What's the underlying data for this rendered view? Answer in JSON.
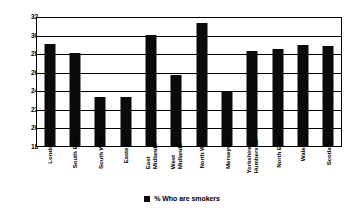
{
  "chart_data": {
    "type": "bar",
    "title": "",
    "xlabel": "",
    "ylabel": "",
    "ylim": [
      18,
      32
    ],
    "ytick_step": 2,
    "yticks": [
      18,
      20,
      22,
      24,
      26,
      28,
      30,
      32
    ],
    "grid": true,
    "legend_position": "bottom-center",
    "series": [
      {
        "name": "% Who are smokers",
        "color": "#0a0a0a",
        "values": [
          29.2,
          28.2,
          23.4,
          23.4,
          30.1,
          25.8,
          31.5,
          24.0,
          28.4,
          28.6,
          29.1,
          28.9
        ]
      }
    ],
    "categories": [
      "London",
      "South East",
      "South West",
      "Eastern",
      "East\nMidlands",
      "West\nMidlands",
      "North West",
      "Merseyside",
      "Yorkshire &\nHumberside",
      "North East",
      "Wales",
      "Scotland"
    ]
  },
  "legend": {
    "entries": [
      {
        "label": "% Who are smokers",
        "swatch_color": "#0a0a0a"
      }
    ]
  },
  "colors": {
    "bar": "#0a0a0a",
    "axis": "#000000",
    "grid": "#000000",
    "background": "#ffffff"
  }
}
